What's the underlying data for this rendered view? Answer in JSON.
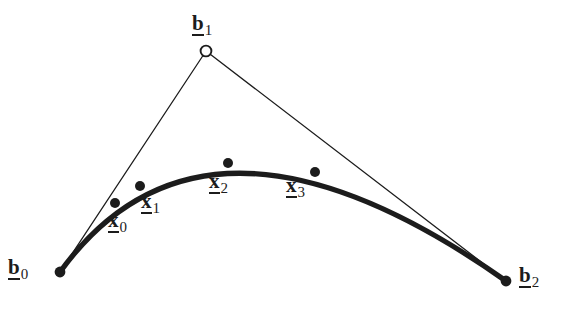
{
  "figure": {
    "background_color": "#ffffff",
    "ink_color": "#1c1c1c",
    "curve_stroke_width": 5.2,
    "polygon_stroke_width": 1.3,
    "width": 567,
    "height": 313
  },
  "control_points": [
    {
      "id": "b0",
      "base": "b",
      "subscript": "0",
      "x": 60,
      "y": 272,
      "marker": "filled-dot",
      "marker_radius": 5.4,
      "label_position": "left"
    },
    {
      "id": "b1",
      "base": "b",
      "subscript": "1",
      "x": 206,
      "y": 51,
      "marker": "open-circle",
      "marker_radius": 5.4,
      "label_position": "above"
    },
    {
      "id": "b2",
      "base": "b",
      "subscript": "2",
      "x": 506,
      "y": 281,
      "marker": "filled-dot",
      "marker_radius": 5.4,
      "label_position": "right"
    }
  ],
  "curve_points": [
    {
      "id": "x0",
      "base": "x",
      "subscript": "0",
      "x": 115,
      "y": 203,
      "marker": "filled-dot",
      "marker_radius": 5.0,
      "label_position": "below-right"
    },
    {
      "id": "x1",
      "base": "x",
      "subscript": "1",
      "x": 140,
      "y": 186,
      "marker": "filled-dot",
      "marker_radius": 5.0,
      "label_position": "right"
    },
    {
      "id": "x2",
      "base": "x",
      "subscript": "2",
      "x": 228,
      "y": 163,
      "marker": "filled-dot",
      "marker_radius": 5.0,
      "label_position": "below"
    },
    {
      "id": "x3",
      "base": "x",
      "subscript": "3",
      "x": 315,
      "y": 172,
      "marker": "filled-dot",
      "marker_radius": 5.0,
      "label_position": "below-left"
    }
  ],
  "geometry": {
    "bezier_path": "M 60 272 Q 206 70 506 281",
    "polygon_segment_1": "M 60 272 L 206 51",
    "polygon_segment_2": "M 206 51 L 506 281"
  },
  "chart_data": {
    "type": "line",
    "xlabel": "",
    "ylabel": "",
    "xlim": [
      0,
      567
    ],
    "ylim": [
      313,
      0
    ],
    "grid": false,
    "legend": null,
    "series": [
      {
        "name": "control polygon",
        "style": "thin-straight",
        "points": [
          [
            60,
            272
          ],
          [
            206,
            51
          ],
          [
            506,
            281
          ]
        ],
        "labels": [
          "b0",
          "b1",
          "b2"
        ]
      },
      {
        "name": "bezier curve",
        "style": "thick-curve",
        "control_points": [
          [
            60,
            272
          ],
          [
            206,
            51
          ],
          [
            506,
            281
          ]
        ],
        "sampled_points": [
          [
            115,
            203
          ],
          [
            140,
            186
          ],
          [
            228,
            163
          ],
          [
            315,
            172
          ]
        ],
        "sampled_labels": [
          "x0",
          "x1",
          "x2",
          "x3"
        ]
      }
    ],
    "annotations": [
      {
        "text": "b0",
        "x": 60,
        "y": 272
      },
      {
        "text": "b1",
        "x": 206,
        "y": 51
      },
      {
        "text": "b2",
        "x": 506,
        "y": 281
      },
      {
        "text": "x0",
        "x": 115,
        "y": 203
      },
      {
        "text": "x1",
        "x": 140,
        "y": 186
      },
      {
        "text": "x2",
        "x": 228,
        "y": 163
      },
      {
        "text": "x3",
        "x": 315,
        "y": 172
      }
    ]
  }
}
